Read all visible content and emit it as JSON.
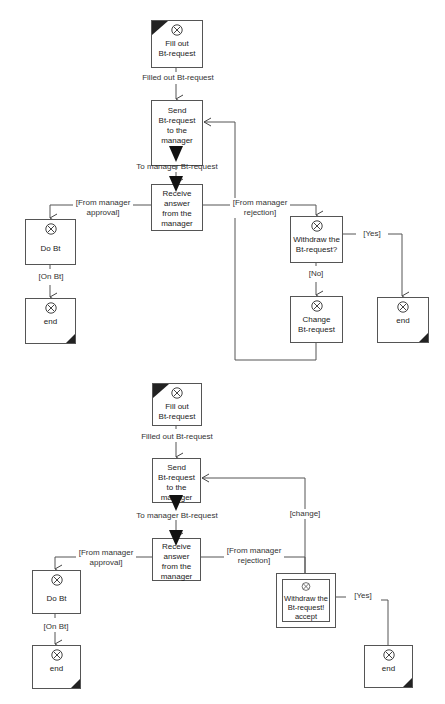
{
  "diagrams": [
    {
      "nodes": {
        "fill_out": "Fill out\nBt-request",
        "send": "Send\nBt-request\nto the manager",
        "receive": "Receive\nanswer\nfrom the\nmanager",
        "do_bt": "Do Bt",
        "end_left": "end",
        "withdraw": "Withdraw the\nBt-request?",
        "change": "Change\nBt-request",
        "end_right": "end"
      },
      "edges": {
        "filled_out": "Filled out Bt-request",
        "to_manager": "To manager Bt-request",
        "approval": "[From manager\napproval]",
        "rejection": "[From manager\nrejection]",
        "on_bt": "[On Bt]",
        "yes": "[Yes]",
        "no": "[No]"
      }
    },
    {
      "nodes": {
        "fill_out": "Fill out\nBt-request",
        "send": "Send\nBt-request\nto the manager",
        "receive": "Receive\nanswer\nfrom the\nmanager",
        "do_bt": "Do Bt",
        "end_left": "end",
        "withdraw": "Withdraw the\nBt-request!\naccept",
        "end_right": "end"
      },
      "edges": {
        "filled_out": "Filled out Bt-request",
        "to_manager": "To manager Bt-request",
        "approval": "[From manager\napproval]",
        "rejection": "[From manager\nrejection]",
        "on_bt": "[On Bt]",
        "yes": "[Yes]",
        "change": "[change]"
      }
    }
  ],
  "colors": {
    "line": "#555555",
    "fill": "#ffffff",
    "marker": "#111111"
  }
}
